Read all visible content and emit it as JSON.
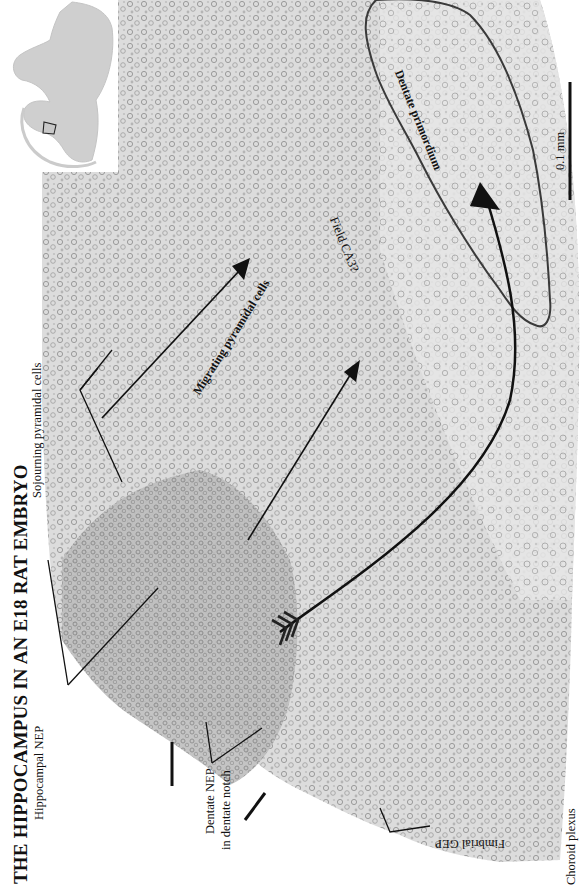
{
  "figure": {
    "title": "THE HIPPOCAMPUS IN AN E18 RAT EMBRYO",
    "scale_bar": {
      "label": "0.1 mm"
    },
    "inset": {
      "description": "low-magnification coronal section with boxed hippocampal region"
    },
    "labels": {
      "sojourning": "Sojourning pyramidal cells",
      "hippocampal_nep": "Hippocampal NEP",
      "dentate_nep_line1": "Dentate NEP",
      "dentate_nep_line2": "in dentate notch",
      "fimbrial_gep": "Fimbrial GEP",
      "choroid_plexus": "Choroid plexus",
      "migrating": "Migrating pyramidal cells",
      "field_ca3": "Field CA3?",
      "dentate_primordium": "Dentate primordium"
    },
    "colors": {
      "tissue_light": "#d4d4d4",
      "tissue_dense": "#a9a9a9",
      "ink": "#111111",
      "outline": "#3a3a3a",
      "background": "#ffffff"
    }
  }
}
